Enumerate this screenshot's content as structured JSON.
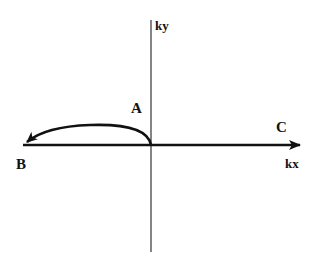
{
  "diagram": {
    "type": "k-space trajectory",
    "axes": {
      "horizontal_label": "kx",
      "vertical_label": "ky"
    },
    "points": {
      "A": "A",
      "B": "B",
      "C": "C"
    },
    "colors": {
      "background": "#ffffff",
      "stroke": "#111111",
      "axis_thin": "#333333"
    }
  }
}
